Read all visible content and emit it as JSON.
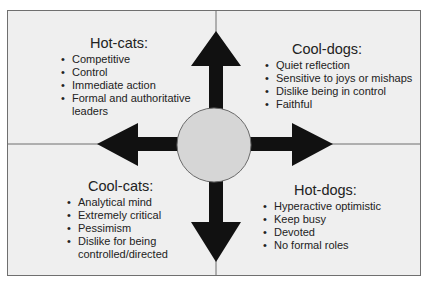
{
  "colors": {
    "background": "#efefef",
    "frame": "#6f6f6f",
    "arrow": "#111111",
    "circle_fill": "#d6d6d6",
    "text": "#222222"
  },
  "quadrants": {
    "hot_cats": {
      "title": "Hot-cats:",
      "items": [
        "Competitive",
        "Control",
        "Immediate action",
        "Formal and authoritative leaders"
      ]
    },
    "cool_dogs": {
      "title": "Cool-dogs:",
      "items": [
        "Quiet reflection",
        "Sensitive to joys or mishaps",
        "Dislike being in control",
        "Faithful"
      ]
    },
    "cool_cats": {
      "title": "Cool-cats:",
      "items": [
        "Analytical mind",
        "Extremely critical",
        "Pessimism",
        "Dislike for being controlled/directed"
      ]
    },
    "hot_dogs": {
      "title": "Hot-dogs:",
      "items": [
        "Hyperactive optimistic",
        "Keep busy",
        "Devoted",
        "No formal roles"
      ]
    }
  },
  "arrows": [
    "up",
    "down",
    "left",
    "right"
  ],
  "center": {
    "shape": "circle"
  }
}
